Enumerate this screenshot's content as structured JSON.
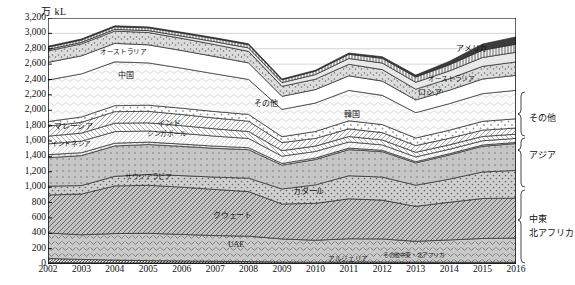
{
  "chart_data": {
    "type": "area",
    "stacked": true,
    "title": "",
    "unit_label": "万 kL",
    "xlabel": "",
    "ylabel": "万 kL",
    "grid": true,
    "legend_position": "inline-and-right-brackets",
    "ylim": [
      0,
      3200
    ],
    "ytick_step": 200,
    "yticks": [
      "0",
      "200",
      "400",
      "600",
      "800",
      "1,000",
      "1,200",
      "1,400",
      "1,600",
      "1,800",
      "2,000",
      "2,200",
      "2,400",
      "2,600",
      "2,800",
      "3,000",
      "3,200"
    ],
    "x": [
      2002,
      2003,
      2004,
      2005,
      2006,
      2007,
      2008,
      2009,
      2010,
      2011,
      2012,
      2013,
      2014,
      2015,
      2016
    ],
    "xticks": [
      "2002",
      "2003",
      "2004",
      "2005",
      "2006",
      "2007",
      "2008",
      "2009",
      "2010",
      "2011",
      "2012",
      "2013",
      "2014",
      "2015",
      "2016"
    ],
    "series": [
      {
        "name": "その他中東・北アフリカ",
        "group": "中東・北アフリカ",
        "pattern": "solid-dark",
        "values": [
          18,
          16,
          15,
          14,
          14,
          13,
          12,
          10,
          10,
          12,
          12,
          12,
          11,
          10,
          10
        ]
      },
      {
        "name": "アルジェリア",
        "group": "中東・北アフリカ",
        "pattern": "dark-line",
        "values": [
          55,
          44,
          36,
          30,
          26,
          22,
          20,
          16,
          14,
          16,
          14,
          13,
          12,
          12,
          12
        ]
      },
      {
        "name": "UAE",
        "group": "中東・北アフリカ",
        "pattern": "chevron",
        "values": [
          330,
          320,
          345,
          355,
          345,
          335,
          330,
          300,
          285,
          300,
          300,
          270,
          290,
          310,
          315
        ]
      },
      {
        "name": "クウェート",
        "group": "中東・北アフリカ",
        "pattern": "diag-hatch",
        "values": [
          495,
          530,
          620,
          625,
          615,
          600,
          580,
          455,
          480,
          520,
          505,
          455,
          490,
          520,
          520
        ]
      },
      {
        "name": "カタール",
        "group": "中東・北アフリカ",
        "pattern": "dot-grey",
        "values": [
          115,
          110,
          125,
          140,
          150,
          160,
          175,
          195,
          240,
          300,
          300,
          275,
          300,
          345,
          360
        ]
      },
      {
        "name": "サウジアラビア",
        "group": "中東・北アフリカ",
        "pattern": "dot-med",
        "values": [
          370,
          390,
          395,
          390,
          380,
          375,
          370,
          310,
          330,
          340,
          330,
          290,
          315,
          335,
          350
        ]
      },
      {
        "name": "その他アジア",
        "group": "アジア",
        "pattern": "dot-fine",
        "values": [
          40,
          38,
          36,
          32,
          30,
          28,
          26,
          22,
          20,
          20,
          18,
          16,
          16,
          16,
          15
        ]
      },
      {
        "name": "インドネシア",
        "group": "アジア",
        "pattern": "light-line",
        "values": [
          140,
          150,
          150,
          145,
          140,
          130,
          120,
          95,
          85,
          80,
          70,
          62,
          58,
          55,
          52
        ]
      },
      {
        "name": "シンガポール",
        "group": "アジア",
        "pattern": "diag-thin",
        "values": [
          100,
          105,
          110,
          105,
          100,
          95,
          90,
          72,
          70,
          70,
          65,
          60,
          58,
          56,
          55
        ]
      },
      {
        "name": "マレーシア",
        "group": "アジア",
        "pattern": "hatch-light",
        "values": [
          130,
          140,
          150,
          150,
          145,
          140,
          135,
          105,
          100,
          100,
          95,
          88,
          85,
          82,
          80
        ]
      },
      {
        "name": "インド",
        "group": "アジア",
        "pattern": "dot-open",
        "values": [
          60,
          70,
          78,
          80,
          82,
          85,
          88,
          76,
          90,
          105,
          105,
          98,
          105,
          115,
          120
        ]
      },
      {
        "name": "中国",
        "group": "アジア",
        "pattern": "wave-light",
        "values": [
          540,
          560,
          570,
          550,
          520,
          490,
          455,
          355,
          370,
          395,
          380,
          330,
          345,
          360,
          370
        ]
      },
      {
        "name": "韓国",
        "group": "アジア",
        "pattern": "plain-light",
        "values": [
          230,
          235,
          240,
          235,
          230,
          225,
          215,
          170,
          175,
          190,
          185,
          165,
          175,
          190,
          195
        ]
      },
      {
        "name": "その他",
        "group": "その他",
        "pattern": "dot-grey2",
        "values": [
          150,
          155,
          160,
          160,
          158,
          155,
          150,
          130,
          135,
          150,
          150,
          140,
          150,
          165,
          175
        ]
      },
      {
        "name": "ロシア",
        "group": "その他",
        "pattern": "light-grey",
        "values": [
          18,
          20,
          22,
          25,
          30,
          38,
          45,
          48,
          60,
          75,
          85,
          90,
          100,
          115,
          125
        ]
      },
      {
        "name": "オーストラリア",
        "group": "その他",
        "pattern": "vert-hatch",
        "values": [
          30,
          32,
          34,
          36,
          38,
          40,
          42,
          38,
          45,
          55,
          62,
          68,
          80,
          95,
          105
        ]
      },
      {
        "name": "アメリカ",
        "group": "その他",
        "pattern": "dark-solid",
        "values": [
          12,
          12,
          12,
          12,
          12,
          12,
          12,
          10,
          12,
          16,
          20,
          25,
          45,
          80,
          95
        ]
      }
    ],
    "inline_labels": [
      {
        "text": "オーストラリア",
        "x": 100,
        "y": 49
      },
      {
        "text": "中国",
        "x": 118,
        "y": 72
      },
      {
        "text": "マレーシア",
        "x": 54,
        "y": 123
      },
      {
        "text": "インドネシア",
        "x": 51,
        "y": 141
      },
      {
        "text": "インド",
        "x": 157,
        "y": 120
      },
      {
        "text": "シンガポール",
        "x": 147,
        "y": 131
      },
      {
        "text": "サウジアラビア",
        "x": 125,
        "y": 174
      },
      {
        "text": "クウェート",
        "x": 213,
        "y": 212
      },
      {
        "text": "UAE",
        "x": 228,
        "y": 241
      },
      {
        "text": "その他中東・北アフリカ",
        "x": 383,
        "y": 253
      },
      {
        "text": "アルジェリア",
        "x": 328,
        "y": 256
      },
      {
        "text": "その他",
        "x": 254,
        "y": 100
      },
      {
        "text": "韓国",
        "x": 344,
        "y": 111
      },
      {
        "text": "カタール",
        "x": 293,
        "y": 188
      },
      {
        "text": "ロシア",
        "x": 418,
        "y": 89
      },
      {
        "text": "オーストラリア",
        "x": 428,
        "y": 76
      },
      {
        "text": "アメリカ",
        "x": 456,
        "y": 45
      }
    ],
    "right_group_labels": [
      {
        "text": "その他",
        "top": 95
      },
      {
        "text": "アジア",
        "top": 132
      },
      {
        "text": "中東",
        "top": 196
      },
      {
        "text": "北アフリカ",
        "top": 210
      }
    ]
  }
}
